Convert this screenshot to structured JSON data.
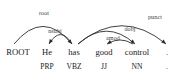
{
  "figure": {
    "type": "dependency-parse",
    "sentence": "He has good control .",
    "background_color": "#ffffff",
    "ink_color": "#2b2b2b"
  },
  "tokens": [
    {
      "word": "ROOT",
      "pos": "",
      "x": 18,
      "word_size": 8.6
    },
    {
      "word": "He",
      "pos": "PRP",
      "x": 47,
      "word_size": 8.6
    },
    {
      "word": "has",
      "pos": "VBZ",
      "x": 74,
      "word_size": 8.6
    },
    {
      "word": "good",
      "pos": "JJ",
      "x": 104,
      "word_size": 8.6
    },
    {
      "word": "control",
      "pos": "NN",
      "x": 137,
      "word_size": 8.6
    },
    {
      "word": ".",
      "pos": ".",
      "x": 167,
      "word_size": 8.6
    }
  ],
  "arcs": [
    {
      "label": "root",
      "head": "ROOT",
      "dep": "has",
      "head_x": 14,
      "dep_x": 72,
      "apex_y": 18,
      "label_x": 44,
      "label_y": 13,
      "direction": "right"
    },
    {
      "label": "nsubj",
      "head": "has",
      "dep": "He",
      "head_x": 72,
      "dep_x": 49,
      "apex_y": 30,
      "label_x": 55,
      "label_y": 31,
      "direction": "left"
    },
    {
      "label": "punct",
      "head": "has",
      "dep": ".",
      "head_x": 78,
      "dep_x": 166,
      "apex_y": 17,
      "label_x": 155,
      "label_y": 17,
      "direction": "right"
    },
    {
      "label": "dobj",
      "head": "has",
      "dep": "control",
      "head_x": 78,
      "dep_x": 135,
      "apex_y": 25,
      "label_x": 130,
      "label_y": 29,
      "direction": "right"
    },
    {
      "label": "amod",
      "head": "control",
      "dep": "good",
      "head_x": 133,
      "dep_x": 107,
      "apex_y": 38,
      "label_x": 113,
      "label_y": 38,
      "direction": "left"
    }
  ],
  "labels": {
    "root": "root",
    "nsubj": "nsubj",
    "punct": "punct",
    "dobj": "dobj",
    "amod": "amod"
  }
}
